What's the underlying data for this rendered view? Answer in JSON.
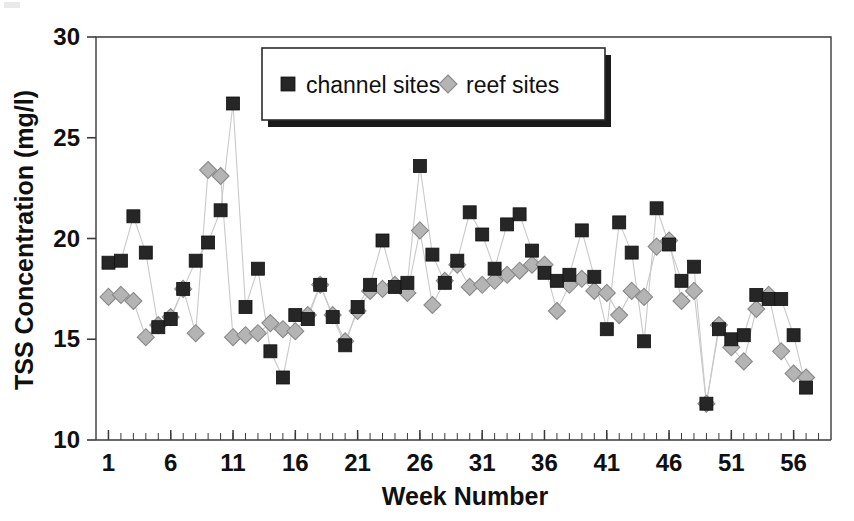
{
  "chart_data": {
    "type": "line",
    "title": "",
    "xlabel": "Week Number",
    "ylabel": "TSS Concentration (mg/l)",
    "xlim": [
      0,
      59
    ],
    "ylim": [
      10,
      30
    ],
    "xticks": [
      1,
      6,
      11,
      16,
      21,
      26,
      31,
      36,
      41,
      46,
      51,
      56
    ],
    "xtick_labels": [
      "1",
      "6",
      "11",
      "16",
      "21",
      "26",
      "31",
      "36",
      "41",
      "46",
      "51",
      "56"
    ],
    "yticks": [
      10,
      15,
      20,
      25,
      30
    ],
    "ytick_labels": [
      "10",
      "15",
      "20",
      "25",
      "30"
    ],
    "minor_xticks": true,
    "grid": false,
    "legend_position": "top-center",
    "x": [
      1,
      2,
      3,
      4,
      5,
      6,
      7,
      8,
      9,
      10,
      11,
      12,
      13,
      14,
      15,
      16,
      17,
      18,
      19,
      20,
      21,
      22,
      23,
      24,
      25,
      26,
      27,
      28,
      29,
      30,
      31,
      32,
      33,
      34,
      35,
      36,
      37,
      38,
      39,
      40,
      41,
      42,
      43,
      44,
      45,
      46,
      47,
      48,
      49,
      50,
      51,
      52,
      53,
      54,
      55,
      56,
      57
    ],
    "series": [
      {
        "name": "channel sites",
        "marker": "square",
        "color": "#262626",
        "values": [
          18.8,
          18.9,
          21.1,
          19.3,
          15.6,
          16.0,
          17.5,
          18.9,
          19.8,
          21.4,
          26.7,
          16.6,
          18.5,
          14.4,
          13.1,
          16.2,
          16.0,
          17.7,
          16.1,
          14.7,
          16.6,
          17.7,
          19.9,
          17.6,
          17.8,
          23.6,
          19.2,
          17.8,
          18.9,
          21.3,
          20.2,
          18.5,
          20.7,
          21.2,
          19.4,
          18.3,
          17.9,
          18.2,
          20.4,
          18.1,
          15.5,
          20.8,
          19.3,
          14.9,
          21.5,
          19.7,
          17.9,
          18.6,
          11.8,
          15.5,
          15.0,
          15.2,
          17.2,
          17.0,
          17.0,
          15.2,
          12.6
        ]
      },
      {
        "name": "reef sites",
        "marker": "diamond",
        "color": "#b4b4b4",
        "values": [
          17.1,
          17.2,
          16.9,
          15.1,
          15.7,
          16.1,
          17.5,
          15.3,
          23.4,
          23.1,
          15.1,
          15.2,
          15.3,
          15.8,
          15.5,
          15.4,
          16.2,
          17.7,
          16.2,
          14.9,
          16.4,
          17.4,
          17.5,
          17.7,
          17.3,
          20.4,
          16.7,
          17.9,
          18.7,
          17.6,
          17.7,
          17.9,
          18.2,
          18.4,
          18.7,
          18.7,
          16.4,
          17.7,
          18.0,
          17.4,
          17.3,
          16.2,
          17.4,
          17.1,
          19.6,
          19.9,
          16.9,
          17.4,
          11.8,
          15.7,
          14.6,
          13.9,
          16.5,
          17.2,
          14.4,
          13.3,
          13.1
        ]
      }
    ],
    "legend": [
      {
        "label": "channel sites",
        "marker": "square",
        "color": "#262626"
      },
      {
        "label": "reef sites",
        "marker": "diamond",
        "color": "#b4b4b4"
      }
    ]
  },
  "colors": {
    "axis": "#3a3a3a",
    "channel_marker": "#262626",
    "reef_marker": "#b4b4b4",
    "reef_marker_edge": "#8a8a8a",
    "connector": "#c9c9c9",
    "background": "#ffffff"
  }
}
